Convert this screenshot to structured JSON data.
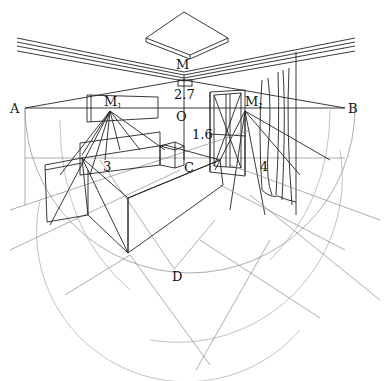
{
  "figure": {
    "type": "perspective-construction-drawing",
    "colors": {
      "background": "#ffffff",
      "main_line": "#222222",
      "construction_line": "#8a8a8a"
    }
  },
  "labels": {
    "M": "M",
    "M1": "M",
    "M1_sub": "1",
    "M2": "M",
    "M2_sub": "2",
    "A": "A",
    "B": "B",
    "O": "O",
    "C": "C",
    "D": "D",
    "height_ceiling": "2.7",
    "height_window": "1.6",
    "dim_left": "3",
    "dim_right": "4"
  },
  "elements": [
    {
      "name": "ceiling-light",
      "label": "M"
    },
    {
      "name": "horizon-line",
      "from": "A",
      "to": "B"
    },
    {
      "name": "left-measuring-point",
      "label": "M1"
    },
    {
      "name": "right-measuring-point",
      "label": "M2"
    },
    {
      "name": "wall-picture-frame"
    },
    {
      "name": "window",
      "height": "1.6"
    },
    {
      "name": "curtain"
    },
    {
      "name": "sofa",
      "dimension": "3"
    },
    {
      "name": "side-table"
    },
    {
      "name": "floor-corner",
      "label": "C"
    },
    {
      "name": "station-point-arc",
      "bottom": "D"
    },
    {
      "name": "ceiling-height-marker",
      "value": "2.7"
    },
    {
      "name": "right-wall-dimension",
      "value": "4"
    }
  ]
}
